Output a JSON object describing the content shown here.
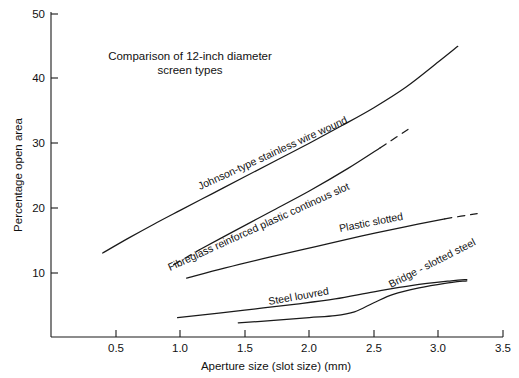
{
  "chart_data": {
    "type": "line",
    "title_line1": "Comparison of 12-inch diameter",
    "title_line2": "screen types",
    "xlabel": "Aperture size (slot size) (mm)",
    "ylabel": "Percentage open area",
    "xlim": [
      0.0,
      3.5
    ],
    "ylim": [
      0,
      50
    ],
    "xticks": [
      0.5,
      1.0,
      1.5,
      2.0,
      2.5,
      3.0,
      3.5
    ],
    "xtick_labels": [
      "0.5",
      "1.0",
      "1.5",
      "2.0",
      "2.5",
      "3.0",
      "3.5"
    ],
    "yticks": [
      10,
      20,
      30,
      40,
      50
    ],
    "ytick_labels": [
      "10",
      "20",
      "30",
      "40",
      "50"
    ],
    "grid": false,
    "legend_position": "inline-labels",
    "line_color": "#1a1a1a",
    "series": [
      {
        "name": "Johnson-type stainless wire wound",
        "label": "Johnson-type stainless wire wound",
        "style": "solid",
        "x": [
          0.4,
          0.6,
          0.8,
          1.0,
          1.25,
          1.5,
          1.75,
          2.0,
          2.25,
          2.5,
          2.75,
          3.0,
          3.15
        ],
        "y": [
          13.0,
          15.3,
          17.5,
          19.6,
          22.2,
          24.8,
          27.4,
          30.0,
          32.7,
          35.5,
          38.7,
          42.6,
          45.0
        ]
      },
      {
        "name": "Fibreglass reinforced plastic continous slot",
        "label": "Fibreglass reinforced plastic continous slot",
        "style": "dashed-ends",
        "x": [
          0.95,
          1.15,
          1.4,
          1.7,
          2.0,
          2.3,
          2.55,
          2.8
        ],
        "y": [
          11.2,
          13.5,
          16.2,
          19.4,
          22.6,
          26.1,
          29.3,
          32.6
        ]
      },
      {
        "name": "Plastic slotted",
        "label": "Plastic slotted",
        "style": "solid-dashed-end",
        "x": [
          1.05,
          1.35,
          1.7,
          2.05,
          2.4,
          2.75,
          3.05,
          3.3
        ],
        "y": [
          9.1,
          10.7,
          12.4,
          14.0,
          15.6,
          17.1,
          18.3,
          19.1
        ]
      },
      {
        "name": "Steel louvred",
        "label": "Steel louvred",
        "style": "solid",
        "x": [
          0.98,
          1.3,
          1.6,
          1.9,
          2.2,
          2.5,
          2.8,
          3.1,
          3.22
        ],
        "y": [
          3.0,
          3.7,
          4.4,
          5.1,
          5.9,
          7.0,
          8.0,
          8.7,
          8.9
        ]
      },
      {
        "name": "Bridge - slotted steel",
        "label": "Bridge - slotted steel",
        "style": "solid",
        "x": [
          1.45,
          1.75,
          2.0,
          2.2,
          2.35,
          2.5,
          2.65,
          2.85,
          3.05,
          3.22
        ],
        "y": [
          2.2,
          2.6,
          3.0,
          3.3,
          3.9,
          5.3,
          6.6,
          7.6,
          8.3,
          8.7
        ]
      }
    ],
    "series_label_rotations": [
      -25,
      -22,
      -12,
      -11,
      -27
    ]
  }
}
